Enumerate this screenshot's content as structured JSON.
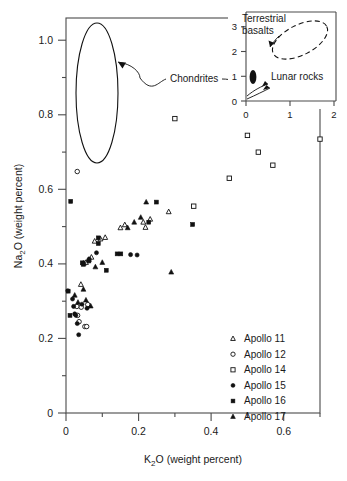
{
  "figure": {
    "kind": "scatter-plot-with-inset",
    "background": "#ffffff",
    "ink_color": "#1a1a1a",
    "frame_color": "#4a4a4a"
  },
  "chart_data": {
    "type": "scatter",
    "title": "",
    "xlabel": "K2O (weight percent)",
    "ylabel": "Na2O (weight percent)",
    "xlabel_parts": {
      "pre": "K",
      "sub": "2",
      "post": "O (weight percent)"
    },
    "ylabel_parts": {
      "pre": "Na",
      "sub": "2",
      "post": "O (weight percent)"
    },
    "xlim": [
      0,
      0.7
    ],
    "ylim": [
      0,
      1.06
    ],
    "xticks": [
      0,
      0.1,
      0.2,
      0.3,
      0.4,
      0.5,
      0.6,
      0.7
    ],
    "xticklabels": [
      "0",
      "",
      "0.2",
      "",
      "0.4",
      "",
      "0.6",
      ""
    ],
    "yticks": [
      0,
      0.1,
      0.2,
      0.3,
      0.4,
      0.5,
      0.6,
      0.7,
      0.8,
      0.9,
      1.0
    ],
    "yticklabels": [
      "0",
      "",
      "0.2",
      "",
      "0.4",
      "",
      "0.6",
      "",
      "0.8",
      "",
      "1.0"
    ],
    "grid": false,
    "legend_position": "lower-right-inside",
    "series": [
      {
        "name": "Apollo 11",
        "marker": "open-triangle",
        "points": [
          [
            0.041,
            0.345
          ],
          [
            0.049,
            0.402
          ],
          [
            0.055,
            0.404
          ],
          [
            0.063,
            0.412
          ],
          [
            0.07,
            0.418
          ],
          [
            0.079,
            0.461
          ],
          [
            0.095,
            0.467
          ],
          [
            0.108,
            0.471
          ],
          [
            0.15,
            0.497
          ],
          [
            0.162,
            0.505
          ],
          [
            0.213,
            0.512
          ],
          [
            0.219,
            0.498
          ],
          [
            0.232,
            0.52
          ],
          [
            0.283,
            0.54
          ]
        ]
      },
      {
        "name": "Apollo 12",
        "marker": "open-circle",
        "points": [
          [
            0.031,
            0.648
          ],
          [
            0.03,
            0.286
          ],
          [
            0.032,
            0.262
          ],
          [
            0.036,
            0.245
          ],
          [
            0.042,
            0.284
          ],
          [
            0.052,
            0.232
          ],
          [
            0.057,
            0.232
          ],
          [
            0.06,
            0.291
          ]
        ]
      },
      {
        "name": "Apollo 14",
        "marker": "open-square",
        "points": [
          [
            0.3,
            0.79
          ],
          [
            0.352,
            0.555
          ],
          [
            0.45,
            0.63
          ],
          [
            0.5,
            0.745
          ],
          [
            0.53,
            0.7
          ],
          [
            0.57,
            0.665
          ],
          [
            0.7,
            0.735
          ]
        ]
      },
      {
        "name": "Apollo 15",
        "marker": "filled-circle",
        "points": [
          [
            0.005,
            0.328
          ],
          [
            0.018,
            0.306
          ],
          [
            0.021,
            0.286
          ],
          [
            0.024,
            0.266
          ],
          [
            0.027,
            0.262
          ],
          [
            0.031,
            0.24
          ],
          [
            0.035,
            0.21
          ],
          [
            0.044,
            0.292
          ],
          [
            0.047,
            0.402
          ],
          [
            0.058,
            0.281
          ],
          [
            0.064,
            0.413
          ],
          [
            0.084,
            0.43
          ],
          [
            0.178,
            0.425
          ],
          [
            0.196,
            0.424
          ]
        ]
      },
      {
        "name": "Apollo 16",
        "marker": "filled-square",
        "points": [
          [
            0.013,
            0.568
          ],
          [
            0.006,
            0.327
          ],
          [
            0.011,
            0.262
          ],
          [
            0.045,
            0.403
          ],
          [
            0.048,
            0.399
          ],
          [
            0.063,
            0.408
          ],
          [
            0.089,
            0.47
          ],
          [
            0.089,
            0.455
          ],
          [
            0.111,
            0.383
          ],
          [
            0.141,
            0.427
          ],
          [
            0.151,
            0.427
          ],
          [
            0.249,
            0.566
          ],
          [
            0.228,
            0.512
          ],
          [
            0.349,
            0.506
          ]
        ]
      },
      {
        "name": "Apollo 17",
        "marker": "filled-triangle",
        "points": [
          [
            0.024,
            0.316
          ],
          [
            0.033,
            0.297
          ],
          [
            0.048,
            0.332
          ],
          [
            0.055,
            0.303
          ],
          [
            0.068,
            0.287
          ],
          [
            0.081,
            0.392
          ],
          [
            0.1,
            0.404
          ],
          [
            0.17,
            0.497
          ],
          [
            0.188,
            0.512
          ],
          [
            0.206,
            0.525
          ],
          [
            0.221,
            0.566
          ],
          [
            0.29,
            0.378
          ]
        ]
      }
    ],
    "annotations": [
      {
        "name": "chondrites",
        "label": "Chondrites",
        "kind": "ellipse-with-arrows",
        "ellipse_center_xy": [
          0.085,
          0.92
        ],
        "note": "tall narrow solid ellipse at upper left"
      }
    ],
    "inset": {
      "xlabel": "",
      "ylabel": "",
      "xlim": [
        0,
        2.05
      ],
      "ylim": [
        0,
        3.6
      ],
      "xticks": [
        0,
        1,
        2
      ],
      "xticklabels": [
        "0",
        "1",
        "2"
      ],
      "yticks": [
        0,
        1,
        2,
        3
      ],
      "yticklabels": [
        "0",
        "1",
        "2",
        "3"
      ],
      "regions": [
        {
          "name": "terrestrial-basalts",
          "label": "Terrestrial basalts",
          "style": "dashed-ellipse",
          "center_xy": [
            1.25,
            2.75
          ]
        },
        {
          "name": "lunar-rocks",
          "label": "Lunar rocks",
          "style": "filled-ellipse",
          "center_xy": [
            0.16,
            0.95
          ]
        }
      ]
    }
  },
  "legend": {
    "items": [
      {
        "label": "Apollo 11",
        "marker": "open-triangle"
      },
      {
        "label": "Apollo 12",
        "marker": "open-circle"
      },
      {
        "label": "Apollo 14",
        "marker": "open-square"
      },
      {
        "label": "Apollo 15",
        "marker": "filled-circle"
      },
      {
        "label": "Apollo 16",
        "marker": "filled-square"
      },
      {
        "label": "Apollo 17",
        "marker": "filled-triangle"
      }
    ]
  },
  "labels": {
    "chondrites": "Chondrites",
    "terrestrial_basalts_line1": "Terrestrial",
    "terrestrial_basalts_line2": "basalts",
    "lunar_rocks": "Lunar rocks"
  }
}
